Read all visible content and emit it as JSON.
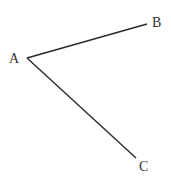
{
  "diagram": {
    "type": "angle",
    "stroke_color": "#2a2a2a",
    "label_color": "#333333",
    "points": {
      "A": {
        "label": "A",
        "x": 27,
        "y": 58
      },
      "B": {
        "label": "B",
        "x": 147,
        "y": 24
      },
      "C": {
        "label": "C",
        "x": 136,
        "y": 158
      }
    },
    "segments": [
      {
        "from": "A",
        "to": "B"
      },
      {
        "from": "A",
        "to": "C"
      }
    ]
  }
}
